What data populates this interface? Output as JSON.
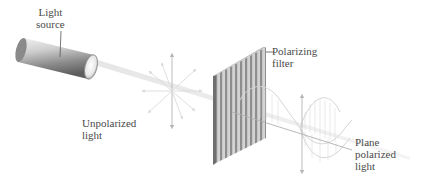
{
  "diagram": {
    "labels": {
      "light_source": "Light\nsource",
      "polarizing_filter": "Polarizing\nfilter",
      "unpolarized_light": "Unpolarized\nlight",
      "plane_polarized_light": "Plane\npolarized\nlight"
    },
    "components": [
      "light-source-cylinder",
      "light-beam",
      "unpolarized-arrows",
      "polarizing-filter",
      "plane-polarized-wave"
    ],
    "colors": {
      "cylinder": "#9a9a9a",
      "beam": "#d9d9d9",
      "arrows": "#c8c8c8",
      "filter_stripe_dark": "#8f8f8f",
      "filter_stripe_light": "#d0d0d0",
      "wave": "#cfcfcf",
      "text": "#4a4a4a"
    }
  }
}
